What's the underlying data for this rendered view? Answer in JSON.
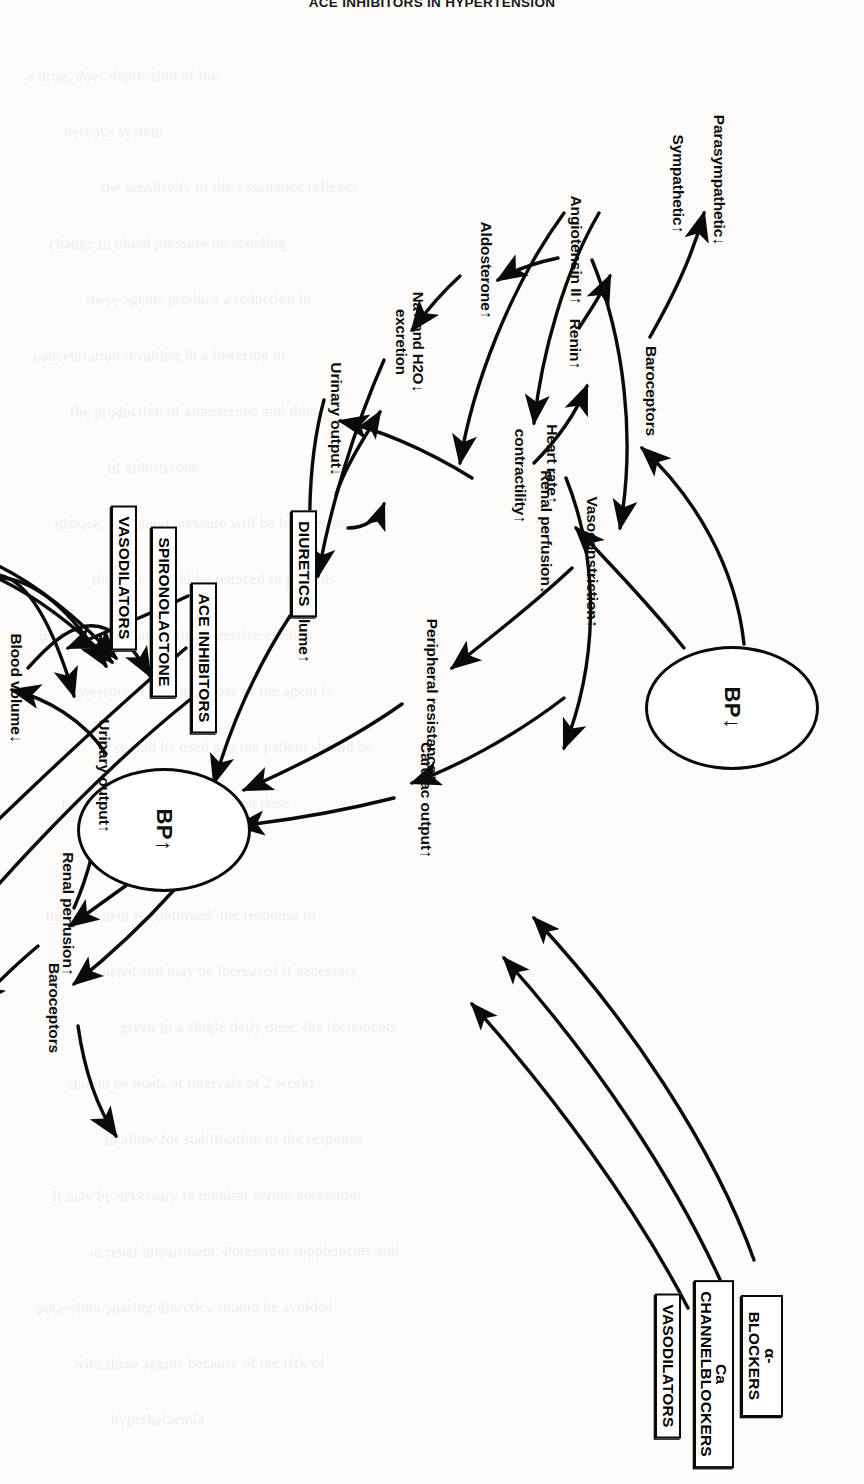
{
  "page": {
    "header_title": "ACE INHIBITORS IN HYPERTENSION",
    "background_text_lines": [
      "a drug, does depression of the",
      "nervous system",
      "the sensitivity of the vasomotor reflexes",
      "change in blood pressure on standing",
      "these agents produce a reduction in",
      "concentration resulting in a lowering of",
      "the production of aldosterone and thus",
      "of aldosterone",
      "disease, the blood pressure will be lowered as",
      "the dose should be reduced in patients",
      "present in patients with congestive cardiac",
      "pressure. The initial dose of the agent is",
      "should be used and the patient should be",
      "for several hours after the first dose",
      "be given at bedtime",
      "the treatment is continued, the response to",
      "adjusted and may be increased if necessary",
      "given in a single daily dose, the increments",
      "should be made at intervals of 2 weeks",
      "to allow for stabilisation of the response",
      "It may be necessary to monitor serum potassium",
      "in renal impairment. Potassium supplements and",
      "potassium-sparing diuretics should be avoided",
      "with these agents because of the risk of",
      "hyperkalaemia"
    ]
  },
  "figure": {
    "nodes": {
      "bp_low": {
        "label": "BP",
        "arrow": "down"
      },
      "bp_high": {
        "label": "BP",
        "arrow": "up"
      },
      "top_loop": [
        {
          "id": "baroceptors-top",
          "label": "Baroceptors",
          "arrow": ""
        },
        {
          "id": "parasympathetic-top",
          "label": "Parasympathetic",
          "arrow": "down"
        },
        {
          "id": "sympathetic-top",
          "label": "Sympathetic",
          "arrow": "up"
        },
        {
          "id": "heart-rate-top",
          "label": "Heart rate",
          "arrow": "up"
        },
        {
          "id": "contractility-top",
          "label": "contractility",
          "arrow": "up"
        },
        {
          "id": "renal-perfusion-top",
          "label": "Renal perfusion",
          "arrow": "down"
        },
        {
          "id": "renin-top",
          "label": "Renin",
          "arrow": "up"
        },
        {
          "id": "angiotensin-top",
          "label": "Angiotensin II",
          "arrow": "up"
        },
        {
          "id": "aldosterone-top",
          "label": "Aldosterone",
          "arrow": "up"
        },
        {
          "id": "na-h2o-top",
          "label": "Na+ and H2O",
          "label2": "excretion",
          "arrow": "down"
        },
        {
          "id": "urinary-output-top",
          "label": "Urinary output",
          "arrow": "down"
        },
        {
          "id": "vasoconstriction-top",
          "label": "Vasoconstriction",
          "arrow": "up"
        },
        {
          "id": "peripheral-resistance-top",
          "label": "Peripheral resistance",
          "arrow": "up"
        },
        {
          "id": "blood-volume-top",
          "label": "Blood volume",
          "arrow": "up"
        },
        {
          "id": "cardiac-output-top",
          "label": "Cardiac output",
          "arrow": "up"
        }
      ],
      "bottom_loop": [
        {
          "id": "baroceptors-bottom",
          "label": "Baroceptors",
          "arrow": ""
        },
        {
          "id": "sympathetic-bottom",
          "label": "Sympathetic",
          "arrow": "down"
        },
        {
          "id": "parasympathetic-bottom",
          "label": "Parasympathetic",
          "arrow": "up"
        },
        {
          "id": "heart-rate-bottom",
          "label": "Heart rate",
          "arrow": "down"
        },
        {
          "id": "contractility-bottom",
          "label": "contractility",
          "arrow": "down"
        },
        {
          "id": "renal-perfusion-bottom",
          "label": "Renal perfusion",
          "arrow": "up"
        },
        {
          "id": "renin-bottom",
          "label": "Renin",
          "arrow": "down"
        },
        {
          "id": "angiotensin-bottom",
          "label": "Angiotensin II",
          "arrow": "doubledown"
        },
        {
          "id": "aldosterone-bottom",
          "label": "Aldosterone",
          "arrow": "down"
        },
        {
          "id": "na-h2o-bottom",
          "label": "Na+ and H2O",
          "label2": "excretion",
          "arrow": "up"
        },
        {
          "id": "urinary-output-bottom",
          "label": "Urinary output",
          "arrow": "up"
        },
        {
          "id": "vasoconstriction-bottom",
          "label": "Vasoconstriction",
          "arrow": "down"
        },
        {
          "id": "peripheral-resistance-bottom",
          "label": "Peripheral resistance",
          "arrow": "down"
        },
        {
          "id": "blood-volume-bottom",
          "label": "Blood volume",
          "arrow": "down"
        },
        {
          "id": "cardiac-output-bottom",
          "label": "Cardiac output",
          "arrow": "down"
        }
      ]
    },
    "drug_boxes": [
      {
        "id": "diuretics",
        "label": "DIURETICS"
      },
      {
        "id": "ace-inhibitors",
        "label": "ACE INHIBITORS"
      },
      {
        "id": "spironolactone",
        "label": "SPIRONOLACTONE"
      },
      {
        "id": "vasodilators-mid",
        "label": "VASODILATORS"
      },
      {
        "id": "beta-blockers",
        "label": "β-BLOCKERS"
      },
      {
        "id": "methyldopa",
        "label": "METHYLDOPA"
      },
      {
        "id": "alpha-blockers",
        "label": "α-BLOCKERS"
      },
      {
        "id": "ca-channel-blockers",
        "label": "Ca CHANNEL",
        "label2": "BLOCKERS"
      },
      {
        "id": "vasodilators-bottom",
        "label": "VASODILATORS"
      }
    ],
    "colors": {
      "ink": "#0a0a0a",
      "paper": "#fdfcfa"
    }
  }
}
